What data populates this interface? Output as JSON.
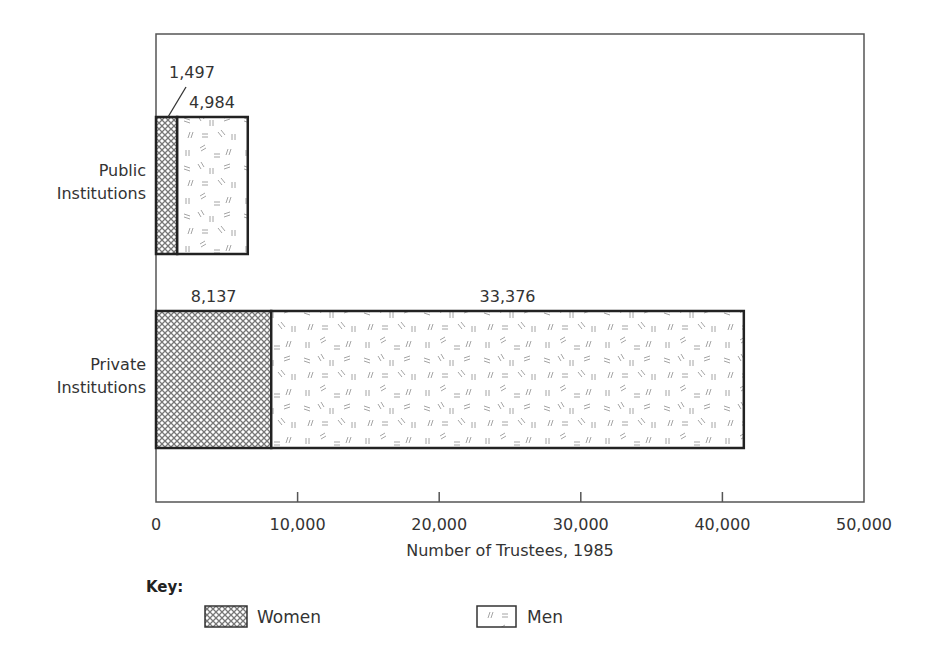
{
  "chart_data": {
    "type": "bar",
    "orientation": "horizontal",
    "stacked": true,
    "title": "",
    "xlabel": "Number of Trustees, 1985",
    "ylabel": "",
    "xlim": [
      0,
      50000
    ],
    "xticks": [
      "0",
      "10,000",
      "20,000",
      "30,000",
      "40,000",
      "50,000"
    ],
    "categories": [
      "Public Institutions",
      "Private Institutions"
    ],
    "category_lines": [
      [
        "Public",
        "Institutions"
      ],
      [
        "Private",
        "Institutions"
      ]
    ],
    "series": [
      {
        "name": "Women",
        "pattern": "crosshatch",
        "values": [
          1497,
          8137
        ],
        "labels": [
          "1,497",
          "8,137"
        ]
      },
      {
        "name": "Men",
        "pattern": "scattered-dashes",
        "values": [
          4984,
          33376
        ],
        "labels": [
          "4,984",
          "33,376"
        ]
      }
    ],
    "grid": false,
    "legend": {
      "title": "Key:",
      "position": "bottom-left",
      "entries": [
        "Women",
        "Men"
      ]
    }
  },
  "colors": {
    "axis": "#555555",
    "bar_outline": "#222222",
    "hatch": "#666666",
    "text": "#333333"
  }
}
